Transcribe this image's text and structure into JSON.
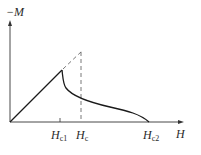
{
  "diagram": {
    "title": "",
    "type": "magnetization-curve",
    "y_axis": {
      "label": "−M"
    },
    "x_axis": {
      "label": "H"
    },
    "markers": [
      {
        "id": "hc1",
        "main": "H",
        "sub": "c1"
      },
      {
        "id": "hc",
        "main": "H",
        "sub": "c"
      },
      {
        "id": "hc2",
        "main": "H",
        "sub": "c2"
      }
    ],
    "colors": {
      "line": "#1a1a1a",
      "axis": "#333333",
      "dashed": "#555555"
    }
  }
}
